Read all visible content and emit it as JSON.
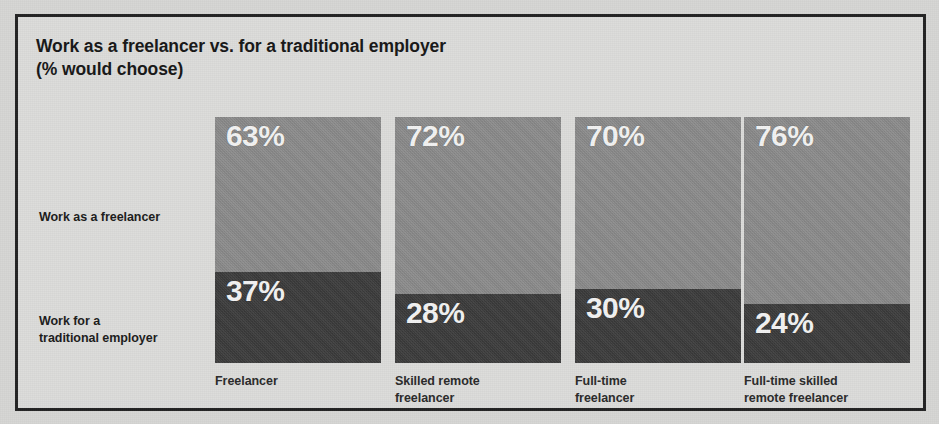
{
  "chart_data": {
    "type": "bar",
    "subtype": "stacked-100-percent",
    "title": "Work as a freelancer vs. for a traditional employer\n(% would choose)",
    "title_line1": "Work as a freelancer vs. for a traditional employer",
    "title_line2": "(% would choose)",
    "xlabel": "",
    "ylabel": "",
    "ylim": [
      0,
      100
    ],
    "grid": false,
    "legend_position": "left-axis-labels",
    "categories": [
      "Freelancer",
      "Skilled remote\nfreelancer",
      "Full-time\nfreelancer",
      "Full-time skilled\nremote freelancer"
    ],
    "series": [
      {
        "name": "Work as a freelancer",
        "color": "#8b8b8b",
        "values": [
          63,
          72,
          70,
          76
        ],
        "labels": [
          "63%",
          "72%",
          "70%",
          "76%"
        ]
      },
      {
        "name": "Work for a\ntraditional employer",
        "color": "#3b3b3b",
        "values": [
          37,
          28,
          30,
          24
        ],
        "labels": [
          "37%",
          "28%",
          "30%",
          "24%"
        ]
      }
    ],
    "axis_labels": {
      "top": "Work as a freelancer",
      "bottom": "Work for a\ntraditional employer"
    },
    "colors": {
      "background": "#dcdcda",
      "border": "#232323",
      "series_top": "#8b8b8b",
      "series_bottom": "#3b3b3b",
      "value_text": "#f2f2f2",
      "label_text": "#1b1b1b"
    }
  }
}
